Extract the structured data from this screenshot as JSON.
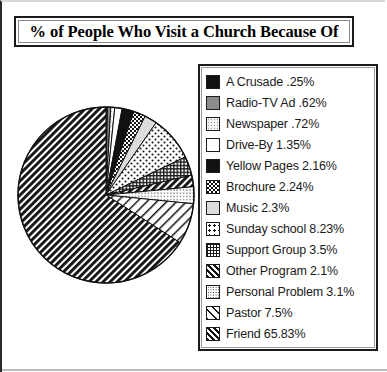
{
  "title": "% of People Who Visit a Church Because Of",
  "chart_data": {
    "type": "pie",
    "title": "% of People Who Visit a Church Because Of",
    "xlabel": "",
    "ylabel": "",
    "legend_position": "right",
    "grid": false,
    "start_angle_deg": 0,
    "direction": "clockwise",
    "categories": [
      "A Crusade",
      "Radio-TV Ad",
      "Newspaper",
      "Drive-By",
      "Yellow Pages",
      "Brochure",
      "Music",
      "Sunday school",
      "Support Group",
      "Other Program",
      "Personal Problem",
      "Pastor",
      "Friend"
    ],
    "values": [
      0.25,
      0.62,
      0.72,
      1.35,
      2.16,
      2.24,
      2.3,
      8.23,
      3.5,
      2.1,
      3.1,
      7.5,
      65.83
    ],
    "value_labels": [
      ".25%",
      ".62%",
      ".72%",
      "1.35%",
      "2.16%",
      "2.24%",
      "2.3%",
      "8.23%",
      "3.5%",
      "2.1%",
      "3.1%",
      "7.5%",
      "65.83%"
    ],
    "unit": "%",
    "total": 100.0
  },
  "legend": {
    "items": [
      {
        "label": "A Crusade  .25%",
        "name": "a-crusade",
        "pattern": "solid-black"
      },
      {
        "label": "Radio-TV Ad  .62%",
        "name": "radio-tv-ad",
        "pattern": "gray"
      },
      {
        "label": "Newspaper  .72%",
        "name": "newspaper",
        "pattern": "faint-dots"
      },
      {
        "label": "Drive-By  1.35%",
        "name": "drive-by",
        "pattern": "white"
      },
      {
        "label": "Yellow Pages  2.16%",
        "name": "yellow-pages",
        "pattern": "solid-black"
      },
      {
        "label": "Brochure  2.24%",
        "name": "brochure",
        "pattern": "checkerboard"
      },
      {
        "label": "Music  2.3%",
        "name": "music",
        "pattern": "light-gray"
      },
      {
        "label": "Sunday school  8.23%",
        "name": "sunday-school",
        "pattern": "sparse-dots"
      },
      {
        "label": "Support Group  3.5%",
        "name": "support-group",
        "pattern": "dense-grid"
      },
      {
        "label": "Other Program  2.1%",
        "name": "other-program",
        "pattern": "dense-diagonal"
      },
      {
        "label": "Personal Problem  3.1%",
        "name": "personal-problem",
        "pattern": "fine-dot-grid"
      },
      {
        "label": "Pastor  7.5%",
        "name": "pastor",
        "pattern": "sparse-diagonal"
      },
      {
        "label": "Friend  65.83%",
        "name": "friend",
        "pattern": "dense-diagonal"
      }
    ]
  },
  "colors": {
    "ink": "#1a1a1a",
    "background": "#ffffff",
    "gray": "#808080",
    "light_gray": "#e0e0e0"
  }
}
